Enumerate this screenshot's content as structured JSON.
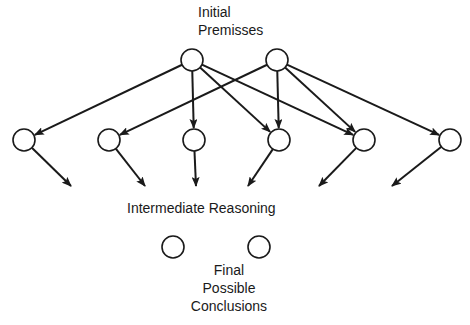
{
  "diagram": {
    "title_top": [
      "Initial",
      "Premisses"
    ],
    "title_middle": "Intermediate Reasoning",
    "title_bottom": [
      "Final",
      "Possible",
      "Conclusions"
    ],
    "node_radius": 11,
    "line_color": "#1a1a1a",
    "nodes": {
      "premises": [
        {
          "id": "P1",
          "x": 192,
          "y": 60
        },
        {
          "id": "P2",
          "x": 277,
          "y": 60
        }
      ],
      "intermediate": [
        {
          "id": "I1",
          "x": 24,
          "y": 140
        },
        {
          "id": "I2",
          "x": 109,
          "y": 140
        },
        {
          "id": "I3",
          "x": 194,
          "y": 140
        },
        {
          "id": "I4",
          "x": 279,
          "y": 140
        },
        {
          "id": "I5",
          "x": 364,
          "y": 140
        },
        {
          "id": "I6",
          "x": 450,
          "y": 140
        }
      ],
      "conclusions": [
        {
          "id": "C1",
          "x": 173,
          "y": 247
        },
        {
          "id": "C2",
          "x": 259,
          "y": 247
        }
      ]
    },
    "edges": [
      {
        "from": "P1",
        "to": "I1"
      },
      {
        "from": "P1",
        "to": "I3"
      },
      {
        "from": "P1",
        "to": "I4"
      },
      {
        "from": "P1",
        "to": "I5"
      },
      {
        "from": "P2",
        "to": "I2"
      },
      {
        "from": "P2",
        "to": "I4"
      },
      {
        "from": "P2",
        "to": "I5"
      },
      {
        "from": "P2",
        "to": "I6"
      }
    ],
    "dangling_arrows": [
      {
        "from": "I1",
        "to_x": 71,
        "to_y": 186
      },
      {
        "from": "I2",
        "to_x": 145,
        "to_y": 186
      },
      {
        "from": "I3",
        "to_x": 196,
        "to_y": 186
      },
      {
        "from": "I4",
        "to_x": 248,
        "to_y": 186
      },
      {
        "from": "I5",
        "to_x": 319,
        "to_y": 186
      },
      {
        "from": "I6",
        "to_x": 392,
        "to_y": 186
      }
    ]
  }
}
